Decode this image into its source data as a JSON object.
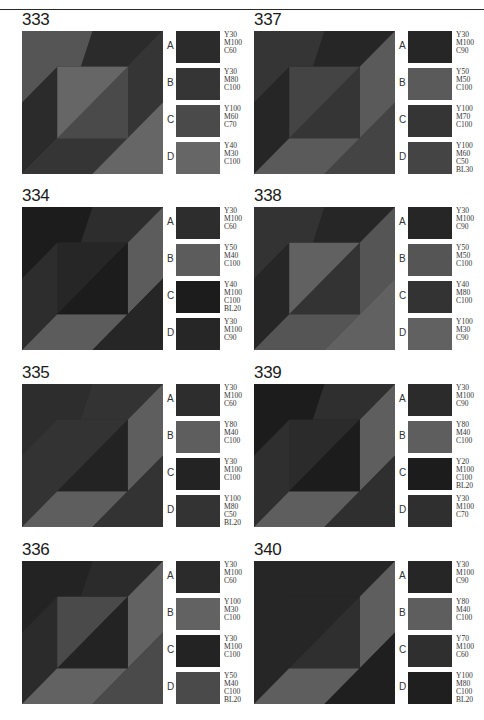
{
  "panels": [
    {
      "number": "333",
      "pos": {
        "left": 22,
        "top": 11
      },
      "swatches": [
        {
          "letter": "A",
          "code": "Y30\nM100\nC60",
          "color": "#2b2b2b"
        },
        {
          "letter": "B",
          "code": "Y30\nM80\nC100",
          "color": "#353535"
        },
        {
          "letter": "C",
          "code": "Y100\nM60\nC70",
          "color": "#4a4a4a"
        },
        {
          "letter": "D",
          "code": "Y40\nM30\nC100",
          "color": "#666666"
        }
      ],
      "pattern": {
        "outer_tl": "#555555",
        "band_top": "#2b2b2b",
        "band_left": "#2b2b2b",
        "inner_tl": "#666666",
        "inner_br": "#4a4a4a",
        "band_right": "#353535",
        "band_bottom": "#353535",
        "outer_br": "#666666"
      }
    },
    {
      "number": "337",
      "pos": {
        "left": 254,
        "top": 11
      },
      "swatches": [
        {
          "letter": "A",
          "code": "Y30\nM100\nC90",
          "color": "#262626"
        },
        {
          "letter": "B",
          "code": "Y50\nM50\nC100",
          "color": "#5a5a5a"
        },
        {
          "letter": "C",
          "code": "Y100\nM70\nC100",
          "color": "#353535"
        },
        {
          "letter": "D",
          "code": "Y100\nM60\nC50\nBL30",
          "color": "#444444"
        }
      ],
      "pattern": {
        "outer_tl": "#353535",
        "band_top": "#262626",
        "band_left": "#262626",
        "inner_tl": "#444444",
        "inner_br": "#353535",
        "band_right": "#5a5a5a",
        "band_bottom": "#5a5a5a",
        "outer_br": "#444444"
      }
    },
    {
      "number": "334",
      "pos": {
        "left": 22,
        "top": 187
      },
      "swatches": [
        {
          "letter": "A",
          "code": "Y30\nM100\nC60",
          "color": "#2d2d2d"
        },
        {
          "letter": "B",
          "code": "Y50\nM40\nC100",
          "color": "#5c5c5c"
        },
        {
          "letter": "C",
          "code": "Y40\nM100\nC100\nBL20",
          "color": "#1c1c1c"
        },
        {
          "letter": "D",
          "code": "Y30\nM100\nC90",
          "color": "#262626"
        }
      ],
      "pattern": {
        "outer_tl": "#1c1c1c",
        "band_top": "#2d2d2d",
        "band_left": "#2d2d2d",
        "inner_tl": "#262626",
        "inner_br": "#1c1c1c",
        "band_right": "#5c5c5c",
        "band_bottom": "#5c5c5c",
        "outer_br": "#262626"
      }
    },
    {
      "number": "338",
      "pos": {
        "left": 254,
        "top": 187
      },
      "swatches": [
        {
          "letter": "A",
          "code": "Y30\nM100\nC90",
          "color": "#262626"
        },
        {
          "letter": "B",
          "code": "Y50\nM50\nC100",
          "color": "#555555"
        },
        {
          "letter": "C",
          "code": "Y40\nM80\nC100",
          "color": "#333333"
        },
        {
          "letter": "D",
          "code": "Y100\nM30\nC90",
          "color": "#616161"
        }
      ],
      "pattern": {
        "outer_tl": "#333333",
        "band_top": "#262626",
        "band_left": "#262626",
        "inner_tl": "#616161",
        "inner_br": "#333333",
        "band_right": "#555555",
        "band_bottom": "#555555",
        "outer_br": "#616161"
      }
    },
    {
      "number": "335",
      "pos": {
        "left": 22,
        "top": 364
      },
      "swatches": [
        {
          "letter": "A",
          "code": "Y30\nM100\nC60",
          "color": "#2d2d2d"
        },
        {
          "letter": "B",
          "code": "Y80\nM40\nC100",
          "color": "#5e5e5e"
        },
        {
          "letter": "C",
          "code": "Y30\nM100\nC100",
          "color": "#232323"
        },
        {
          "letter": "D",
          "code": "Y100\nM80\nC50\nBL20",
          "color": "#333333"
        }
      ],
      "pattern": {
        "outer_tl": "#2d2d2d",
        "band_top": "#333333",
        "band_left": "#333333",
        "inner_tl": "#333333",
        "inner_br": "#232323",
        "band_right": "#5e5e5e",
        "band_bottom": "#5e5e5e",
        "outer_br": "#333333"
      }
    },
    {
      "number": "339",
      "pos": {
        "left": 254,
        "top": 364
      },
      "swatches": [
        {
          "letter": "A",
          "code": "Y30\nM100\nC90",
          "color": "#2b2b2b"
        },
        {
          "letter": "B",
          "code": "Y80\nM40\nC100",
          "color": "#5e5e5e"
        },
        {
          "letter": "C",
          "code": "Y20\nM100\nC100\nBL20",
          "color": "#1c1c1c"
        },
        {
          "letter": "D",
          "code": "Y30\nM100\nC70",
          "color": "#2f2f2f"
        }
      ],
      "pattern": {
        "outer_tl": "#1c1c1c",
        "band_top": "#2f2f2f",
        "band_left": "#2f2f2f",
        "inner_tl": "#2b2b2b",
        "inner_br": "#1c1c1c",
        "band_right": "#5e5e5e",
        "band_bottom": "#5e5e5e",
        "outer_br": "#2f2f2f"
      }
    },
    {
      "number": "336",
      "pos": {
        "left": 22,
        "top": 541
      },
      "swatches": [
        {
          "letter": "A",
          "code": "Y30\nM100\nC60",
          "color": "#2b2b2b"
        },
        {
          "letter": "B",
          "code": "Y100\nM30\nC100",
          "color": "#626262"
        },
        {
          "letter": "C",
          "code": "Y30\nM100\nC100",
          "color": "#232323"
        },
        {
          "letter": "D",
          "code": "Y50\nM40\nC100\nBL20",
          "color": "#4a4a4a"
        }
      ],
      "pattern": {
        "outer_tl": "#232323",
        "band_top": "#2b2b2b",
        "band_left": "#2b2b2b",
        "inner_tl": "#4a4a4a",
        "inner_br": "#232323",
        "band_right": "#626262",
        "band_bottom": "#626262",
        "outer_br": "#4a4a4a"
      }
    },
    {
      "number": "340",
      "pos": {
        "left": 254,
        "top": 541
      },
      "swatches": [
        {
          "letter": "A",
          "code": "Y30\nM100\nC90",
          "color": "#262626"
        },
        {
          "letter": "B",
          "code": "Y80\nM40\nC100",
          "color": "#5e5e5e"
        },
        {
          "letter": "C",
          "code": "Y70\nM100\nC60",
          "color": "#2f2f2f"
        },
        {
          "letter": "D",
          "code": "Y100\nM80\nC100\nBL20",
          "color": "#1f1f1f"
        }
      ],
      "pattern": {
        "outer_tl": "#262626",
        "band_top": "#262626",
        "band_left": "#262626",
        "inner_tl": "#262626",
        "inner_br": "#2f2f2f",
        "band_right": "#5e5e5e",
        "band_bottom": "#5e5e5e",
        "outer_br": "#1f1f1f"
      }
    }
  ]
}
